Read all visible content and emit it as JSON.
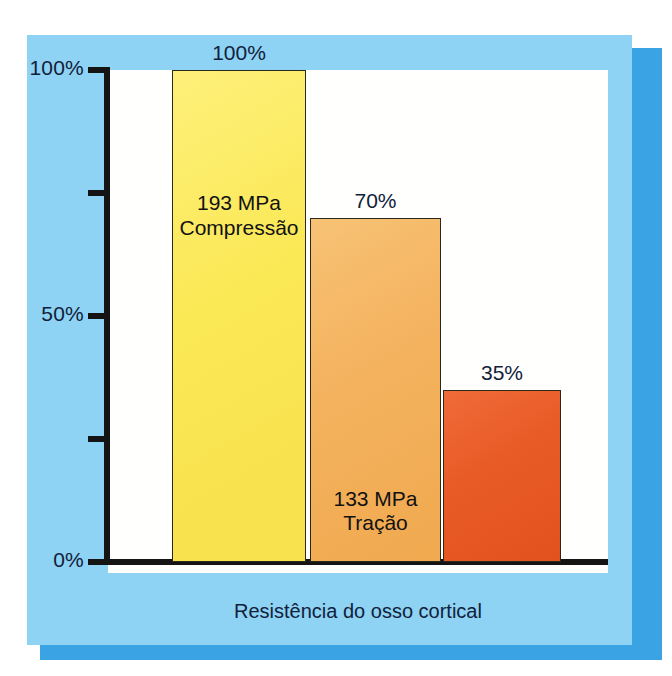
{
  "caption": "Resistência do osso cortical",
  "axis": {
    "ticks": [
      {
        "label": "100%",
        "value": 100,
        "labeled": true
      },
      {
        "label": "",
        "value": 75,
        "labeled": false
      },
      {
        "label": "50%",
        "value": 50,
        "labeled": true
      },
      {
        "label": "",
        "value": 25,
        "labeled": false
      },
      {
        "label": "0%",
        "value": 0,
        "labeled": true
      }
    ]
  },
  "bars": [
    {
      "percent_label": "100%",
      "value_line1": "193 MPa",
      "value_line2": "Compressão",
      "color": "#fbe855"
    },
    {
      "percent_label": "70%",
      "value_line1": "133 MPa",
      "value_line2": "Tração",
      "color": "#f4b25e"
    },
    {
      "percent_label": "35%",
      "value_line1": "68 MPa",
      "value_line2": "Cisalhamento",
      "color": "#e85a26"
    }
  ],
  "colors": {
    "frame": "#8ed2f4",
    "shadow": "#3aa3e3",
    "canvas": "#fffffd",
    "axis": "#141414",
    "text": "#11213a"
  },
  "chart_data": {
    "type": "bar",
    "title": "Resistência do osso cortical",
    "xlabel": "",
    "ylabel": "",
    "ylim": [
      0,
      100
    ],
    "grid": false,
    "legend": "none",
    "categories": [
      "Compressão",
      "Tração",
      "Cisalhamento"
    ],
    "values": [
      100,
      70,
      35
    ],
    "value_labels": [
      "100%",
      "70%",
      "35%"
    ],
    "absolute_values_mpa": [
      193,
      133,
      68
    ],
    "absolute_value_labels": [
      "193 MPa",
      "133 MPa",
      "68 MPa"
    ],
    "bar_colors": [
      "#fbe855",
      "#f4b25e",
      "#e85a26"
    ],
    "ytick_labels": [
      "0%",
      "50%",
      "100%"
    ],
    "ytick_values": [
      0,
      50,
      100
    ],
    "yminor_tick_values": [
      25,
      75
    ],
    "units": "MPa",
    "annotations": [
      "193 MPa Compressão",
      "133 MPa Tração",
      "68 MPa Cisalhamento"
    ]
  }
}
